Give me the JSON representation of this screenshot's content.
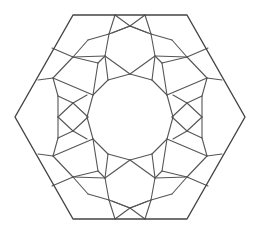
{
  "figure": {
    "title": "",
    "width": 258,
    "height": 231,
    "background": "#ffffff",
    "stroke_color": "#555555",
    "outer_stroke_color": "#444444",
    "stroke_width": 1.1,
    "outer_stroke_width": 1.4
  },
  "geometry": {
    "center": [
      130,
      117
    ],
    "hexagon": [
      [
        73,
        15
      ],
      [
        187,
        15
      ],
      [
        245,
        117
      ],
      [
        187,
        219
      ],
      [
        73,
        219
      ],
      [
        15,
        117
      ]
    ],
    "center_polygon_sides": 12,
    "center_polygon_radius": 43,
    "quadrant_segments": [
      [
        [
          130,
          74
        ],
        [
          152,
          80
        ]
      ],
      [
        [
          152,
          80
        ],
        [
          167,
          95
        ]
      ],
      [
        [
          167,
          95
        ],
        [
          173,
          117
        ]
      ],
      [
        [
          145,
          15
        ],
        [
          130,
          26
        ]
      ],
      [
        [
          130,
          26
        ],
        [
          112,
          33
        ]
      ],
      [
        [
          145,
          15
        ],
        [
          151,
          34
        ]
      ],
      [
        [
          151,
          34
        ],
        [
          130,
          26
        ]
      ],
      [
        [
          151,
          34
        ],
        [
          155,
          56
        ]
      ],
      [
        [
          155,
          56
        ],
        [
          130,
          74
        ]
      ],
      [
        [
          155,
          56
        ],
        [
          152,
          80
        ]
      ],
      [
        [
          151,
          34
        ],
        [
          172,
          40
        ]
      ],
      [
        [
          155,
          56
        ],
        [
          187,
          57
        ]
      ],
      [
        [
          187,
          57
        ],
        [
          208,
          48
        ]
      ],
      [
        [
          187,
          57
        ],
        [
          207,
          78
        ]
      ],
      [
        [
          187,
          57
        ],
        [
          162,
          63
        ]
      ],
      [
        [
          162,
          63
        ],
        [
          167,
          95
        ]
      ],
      [
        [
          162,
          63
        ],
        [
          155,
          56
        ]
      ],
      [
        [
          172,
          40
        ],
        [
          187,
          57
        ]
      ],
      [
        [
          207,
          78
        ],
        [
          222,
          80
        ]
      ],
      [
        [
          207,
          78
        ],
        [
          202,
          96
        ]
      ],
      [
        [
          207,
          78
        ],
        [
          167,
          95
        ]
      ],
      [
        [
          202,
          96
        ],
        [
          187,
          103
        ]
      ],
      [
        [
          202,
          96
        ],
        [
          202,
          117
        ]
      ],
      [
        [
          187,
          103
        ],
        [
          172,
          117
        ]
      ],
      [
        [
          187,
          103
        ],
        [
          202,
          117
        ]
      ],
      [
        [
          173,
          95
        ],
        [
          187,
          103
        ]
      ]
    ]
  }
}
